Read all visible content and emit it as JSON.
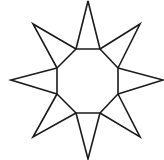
{
  "figure": {
    "shape": "eight-pointed star",
    "stroke_color": "#1a1a1a",
    "background": "#ffffff",
    "center_octagon": [
      [
        76,
        49
      ],
      [
        100,
        49
      ],
      [
        118,
        68
      ],
      [
        118,
        94
      ],
      [
        100,
        113
      ],
      [
        76,
        113
      ],
      [
        57,
        94
      ],
      [
        57,
        68
      ]
    ],
    "star_points": [
      {
        "name": "top",
        "tip": [
          88,
          1
        ],
        "base": [
          [
            76,
            49
          ],
          [
            100,
            49
          ]
        ]
      },
      {
        "name": "upper-right",
        "tip": [
          140,
          24
        ],
        "base": [
          [
            100,
            49
          ],
          [
            118,
            68
          ]
        ]
      },
      {
        "name": "right",
        "tip": [
          163,
          80
        ],
        "base": [
          [
            118,
            68
          ],
          [
            118,
            94
          ]
        ]
      },
      {
        "name": "lower-right",
        "tip": [
          140,
          137
        ],
        "base": [
          [
            118,
            94
          ],
          [
            100,
            113
          ]
        ]
      },
      {
        "name": "bottom",
        "tip": [
          88,
          159
        ],
        "base": [
          [
            100,
            113
          ],
          [
            76,
            113
          ]
        ]
      },
      {
        "name": "lower-left",
        "tip": [
          33,
          137
        ],
        "base": [
          [
            76,
            113
          ],
          [
            57,
            94
          ]
        ]
      },
      {
        "name": "left",
        "tip": [
          11,
          80
        ],
        "base": [
          [
            57,
            94
          ],
          [
            57,
            68
          ]
        ]
      },
      {
        "name": "upper-left",
        "tip": [
          33,
          24
        ],
        "base": [
          [
            57,
            68
          ],
          [
            76,
            49
          ]
        ]
      }
    ]
  }
}
